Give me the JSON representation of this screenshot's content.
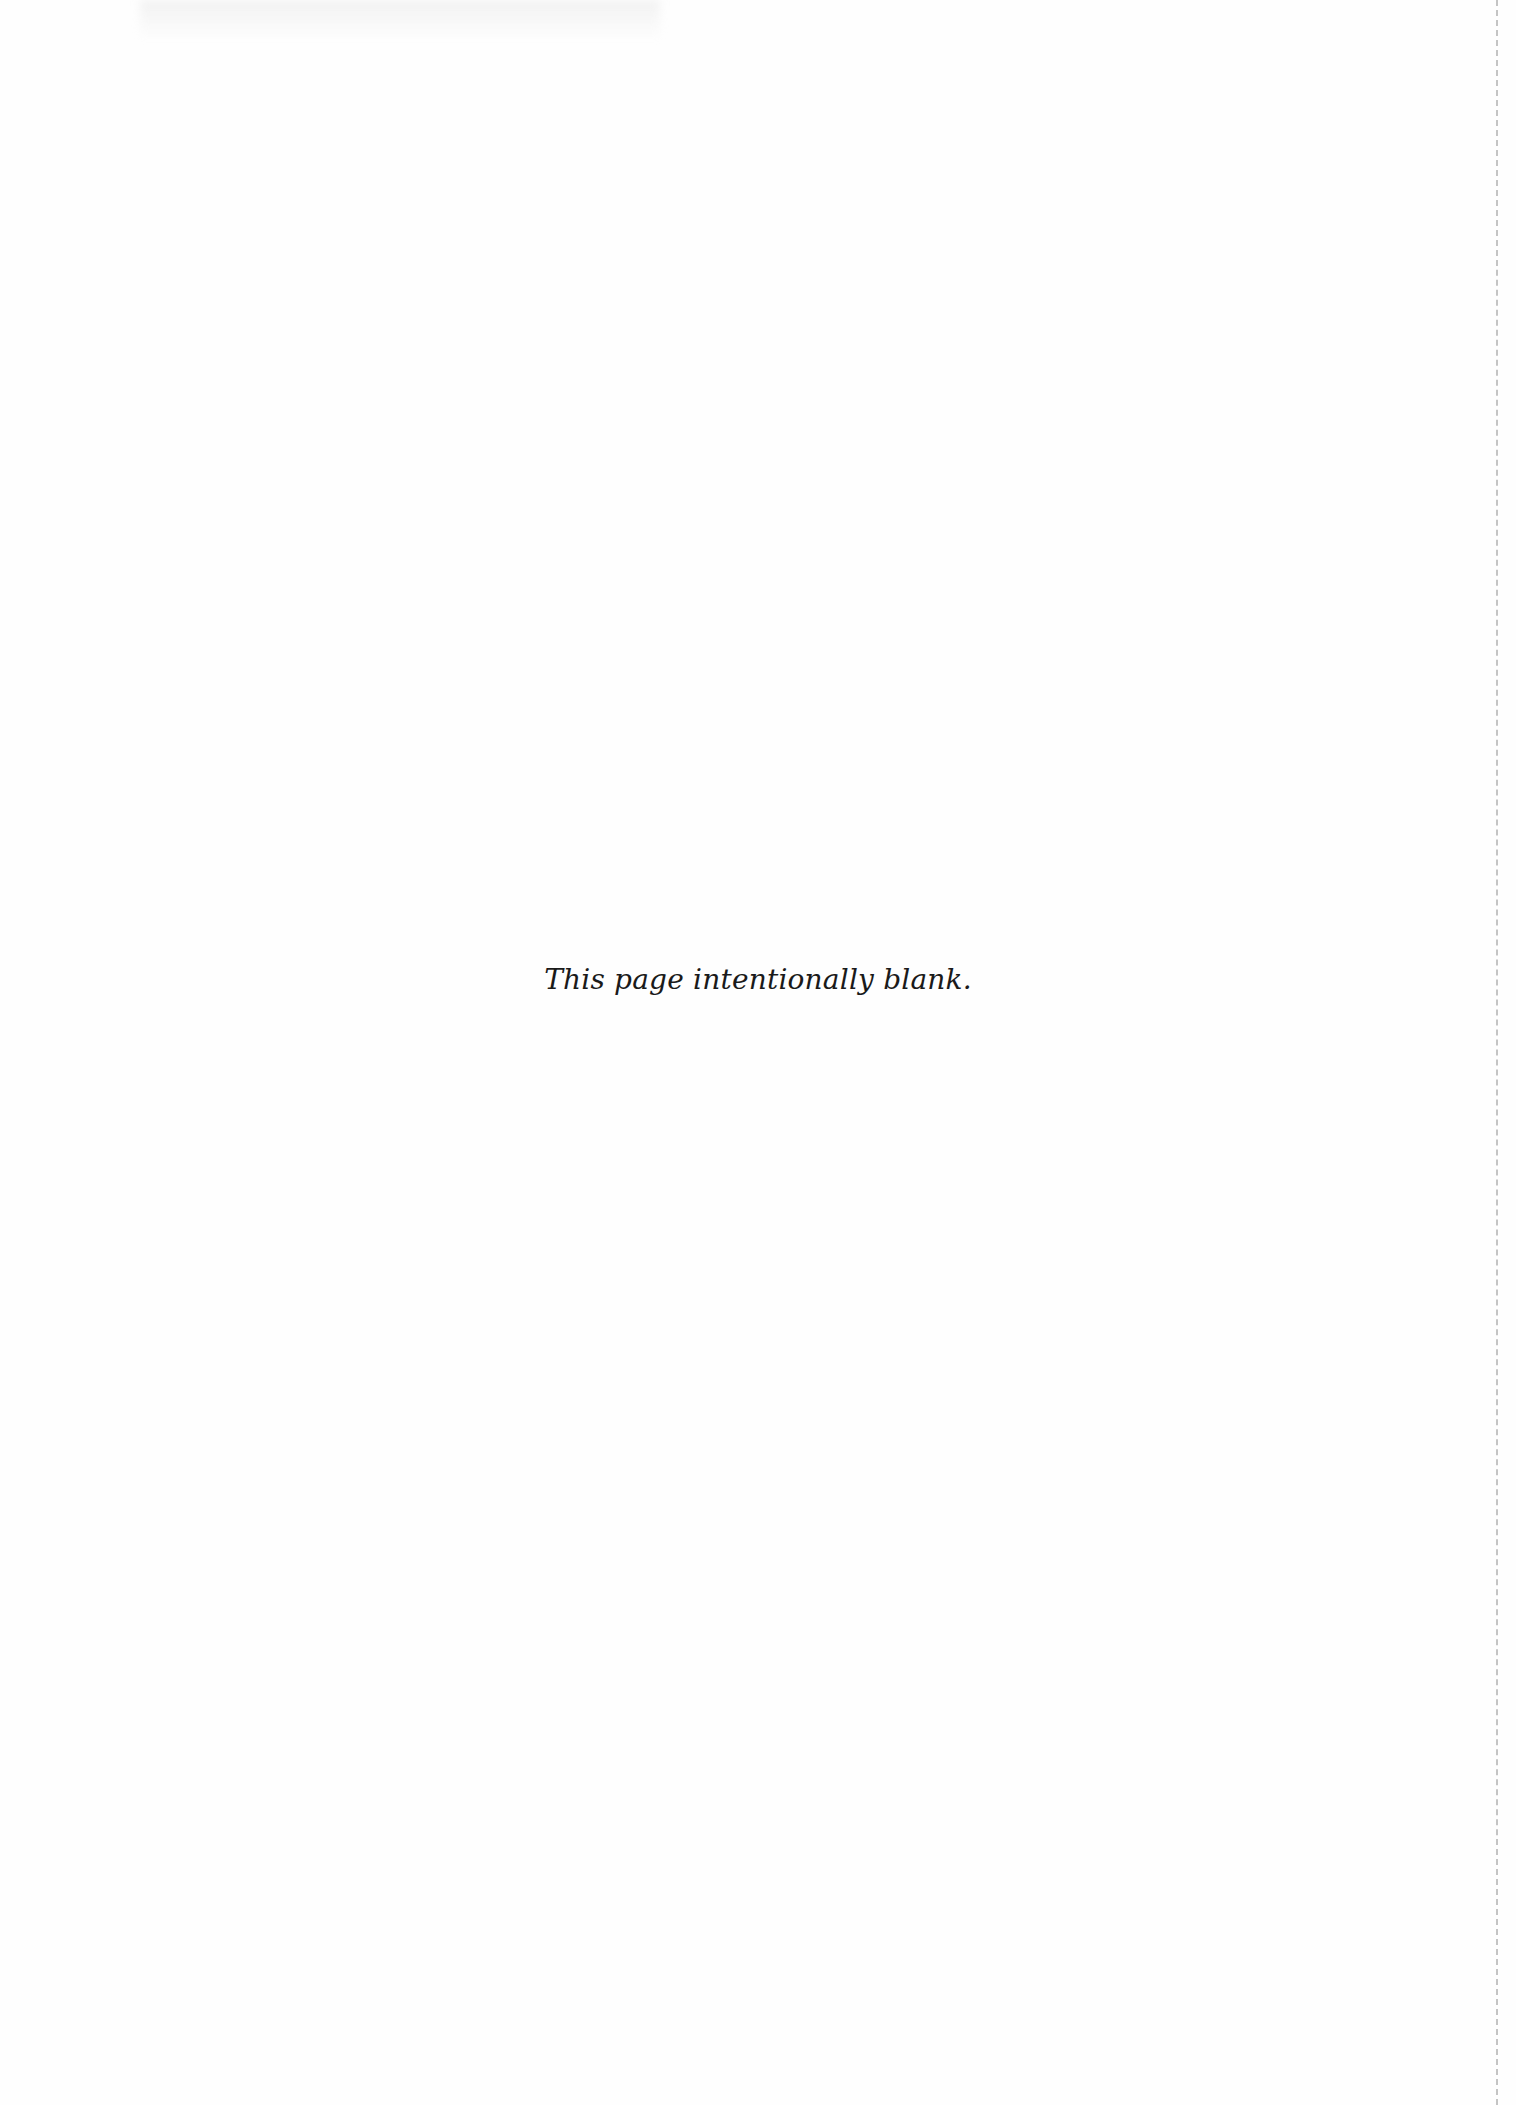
{
  "page": {
    "notice_text": "This page intentionally blank.",
    "background_color": "#fefefe",
    "text_color": "#1a1a1a",
    "edge_line_color": "#c4c4c4"
  }
}
